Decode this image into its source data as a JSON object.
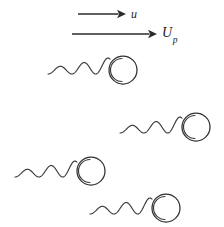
{
  "figure": {
    "kind": "schematic-diagram",
    "background_color": "#ffffff",
    "stroke_color": "#2f2f2f",
    "width": 224,
    "height": 227
  },
  "arrows": [
    {
      "name": "flow-velocity-arrow",
      "label": "u",
      "label_subscript": "",
      "x1": 78,
      "y1": 14,
      "x2": 126,
      "y2": 14,
      "label_x": 131,
      "label_y": 8
    },
    {
      "name": "particle-velocity-arrow",
      "label": "U",
      "label_subscript": "p",
      "x1": 72,
      "y1": 34,
      "x2": 157,
      "y2": 34,
      "label_x": 162,
      "label_y": 26
    }
  ],
  "swimmers": [
    {
      "name": "swimmer-1",
      "tail_start_x": 48,
      "baseline_y": 74,
      "tail_length": 62,
      "head_cx": 123,
      "head_cy": 70,
      "head_r": 14
    },
    {
      "name": "swimmer-2",
      "tail_start_x": 120,
      "baseline_y": 133,
      "tail_length": 62,
      "head_cx": 196,
      "head_cy": 127,
      "head_r": 14
    },
    {
      "name": "swimmer-3",
      "tail_start_x": 15,
      "baseline_y": 177,
      "tail_length": 62,
      "head_cx": 91,
      "head_cy": 171,
      "head_r": 14
    },
    {
      "name": "swimmer-4",
      "tail_start_x": 90,
      "baseline_y": 214,
      "tail_length": 62,
      "head_cx": 166,
      "head_cy": 208,
      "head_r": 14
    }
  ]
}
